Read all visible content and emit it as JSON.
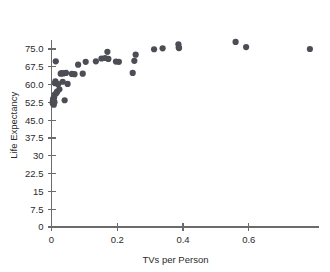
{
  "chart_data": {
    "type": "scatter",
    "title": "",
    "xlabel": "TVs per Person",
    "ylabel": "Life Expectancy",
    "xlim": [
      0,
      0.815
    ],
    "ylim": [
      0,
      79
    ],
    "grid": false,
    "legend": null,
    "xticks": [
      0,
      0.2,
      0.4,
      0.6
    ],
    "xticklabels": [
      "0",
      "0.2",
      "0.4",
      "0.6"
    ],
    "yticks": [
      0,
      7.5,
      15,
      22.5,
      30,
      37.5,
      45.0,
      52.5,
      60.0,
      67.5,
      75.0
    ],
    "yticklabels": [
      "0",
      "7.5",
      "15",
      "22.5",
      "30",
      "37.5",
      "45.0",
      "52.5",
      "60.0",
      "67.5",
      "75.0"
    ],
    "marker_color": "#4d4d55",
    "marker_size": 3.1,
    "points": [
      {
        "x": 0.004,
        "y": 52.0
      },
      {
        "x": 0.004,
        "y": 52.8
      },
      {
        "x": 0.005,
        "y": 53.4
      },
      {
        "x": 0.005,
        "y": 54.0
      },
      {
        "x": 0.006,
        "y": 52.3
      },
      {
        "x": 0.006,
        "y": 53.0
      },
      {
        "x": 0.007,
        "y": 51.5
      },
      {
        "x": 0.008,
        "y": 54.6
      },
      {
        "x": 0.009,
        "y": 52.6
      },
      {
        "x": 0.01,
        "y": 55.8
      },
      {
        "x": 0.011,
        "y": 60.6
      },
      {
        "x": 0.012,
        "y": 61.4
      },
      {
        "x": 0.013,
        "y": 69.8
      },
      {
        "x": 0.015,
        "y": 56.5
      },
      {
        "x": 0.017,
        "y": 57.0
      },
      {
        "x": 0.02,
        "y": 60.2
      },
      {
        "x": 0.024,
        "y": 58.0
      },
      {
        "x": 0.028,
        "y": 64.6
      },
      {
        "x": 0.031,
        "y": 64.8
      },
      {
        "x": 0.034,
        "y": 61.2
      },
      {
        "x": 0.036,
        "y": 64.7
      },
      {
        "x": 0.04,
        "y": 53.4
      },
      {
        "x": 0.044,
        "y": 64.9
      },
      {
        "x": 0.049,
        "y": 60.3
      },
      {
        "x": 0.062,
        "y": 64.5
      },
      {
        "x": 0.07,
        "y": 64.4
      },
      {
        "x": 0.081,
        "y": 68.4
      },
      {
        "x": 0.095,
        "y": 64.6
      },
      {
        "x": 0.104,
        "y": 69.6
      },
      {
        "x": 0.135,
        "y": 69.8
      },
      {
        "x": 0.152,
        "y": 71.0
      },
      {
        "x": 0.163,
        "y": 71.2
      },
      {
        "x": 0.17,
        "y": 73.8
      },
      {
        "x": 0.173,
        "y": 70.8
      },
      {
        "x": 0.196,
        "y": 69.7
      },
      {
        "x": 0.205,
        "y": 69.6
      },
      {
        "x": 0.247,
        "y": 64.9
      },
      {
        "x": 0.252,
        "y": 70.0
      },
      {
        "x": 0.256,
        "y": 72.6
      },
      {
        "x": 0.312,
        "y": 74.9
      },
      {
        "x": 0.338,
        "y": 75.3
      },
      {
        "x": 0.386,
        "y": 77.0
      },
      {
        "x": 0.387,
        "y": 75.6
      },
      {
        "x": 0.388,
        "y": 75.4
      },
      {
        "x": 0.56,
        "y": 78.0
      },
      {
        "x": 0.592,
        "y": 75.8
      },
      {
        "x": 0.786,
        "y": 75.0
      }
    ]
  }
}
